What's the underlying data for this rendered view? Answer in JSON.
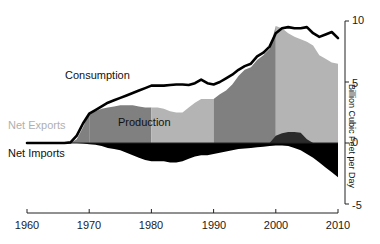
{
  "chart_data": {
    "type": "area",
    "title": "",
    "subtitle": "",
    "xlabel": "",
    "ylabel": "Billion Cubic Feet per Day",
    "xlim": [
      1960,
      2010
    ],
    "ylim": [
      -5,
      10
    ],
    "grid": false,
    "legend_position": "inline-annotations",
    "x_ticks": [
      1960,
      1970,
      1980,
      1990,
      2000,
      2010
    ],
    "y_ticks": [
      -5,
      0,
      5,
      10
    ],
    "annotations": [
      {
        "text": "Consumption",
        "series": "consumption",
        "color": "#111111"
      },
      {
        "text": "Production",
        "series": "production",
        "color": "#111111"
      },
      {
        "text": "Net Exports",
        "series": "net_exports",
        "color": "#b0b0b0"
      },
      {
        "text": "Net Imports",
        "series": "net_imports",
        "color": "#111111"
      }
    ],
    "colors": {
      "production_dark": "#808080",
      "production_light": "#b4b4b4",
      "net_imports": "#000000",
      "net_exports": "#2b2b2b",
      "consumption_line": "#000000",
      "axis": "#222222"
    },
    "x": [
      1960,
      1961,
      1962,
      1963,
      1964,
      1965,
      1966,
      1967,
      1968,
      1969,
      1970,
      1971,
      1972,
      1973,
      1974,
      1975,
      1976,
      1977,
      1978,
      1979,
      1980,
      1981,
      1982,
      1983,
      1984,
      1985,
      1986,
      1987,
      1988,
      1989,
      1990,
      1991,
      1992,
      1993,
      1994,
      1995,
      1996,
      1997,
      1998,
      1999,
      2000,
      2001,
      2002,
      2003,
      2004,
      2005,
      2006,
      2007,
      2008,
      2009,
      2010
    ],
    "series": [
      {
        "name": "Consumption",
        "key": "consumption",
        "type": "line",
        "values": [
          0.0,
          0.0,
          0.0,
          0.0,
          0.0,
          0.0,
          0.0,
          0.05,
          0.6,
          1.6,
          2.4,
          2.7,
          3.0,
          3.3,
          3.5,
          3.7,
          3.9,
          4.1,
          4.3,
          4.5,
          4.7,
          4.7,
          4.7,
          4.75,
          4.8,
          4.8,
          4.75,
          4.9,
          5.2,
          4.9,
          4.8,
          5.0,
          5.3,
          5.6,
          6.0,
          6.3,
          6.5,
          7.1,
          7.4,
          7.9,
          9.0,
          9.4,
          9.5,
          9.4,
          9.4,
          9.5,
          9.0,
          8.7,
          8.9,
          9.1,
          8.6
        ]
      },
      {
        "name": "Production",
        "key": "production",
        "type": "area",
        "values": [
          0.0,
          0.0,
          0.0,
          0.0,
          0.0,
          0.0,
          0.0,
          0.0,
          0.3,
          1.3,
          2.4,
          2.6,
          2.8,
          2.9,
          3.0,
          3.1,
          3.1,
          3.1,
          3.0,
          2.9,
          2.9,
          2.9,
          2.8,
          2.6,
          2.5,
          2.5,
          2.9,
          3.3,
          3.6,
          3.6,
          3.6,
          4.0,
          4.3,
          4.8,
          5.5,
          6.0,
          6.2,
          6.8,
          7.2,
          7.7,
          9.6,
          9.4,
          9.0,
          8.7,
          8.5,
          8.3,
          8.0,
          7.2,
          6.9,
          6.6,
          6.5
        ]
      },
      {
        "name": "Net Imports",
        "key": "net_imports",
        "type": "area",
        "values": [
          0.0,
          0.0,
          0.0,
          0.0,
          0.0,
          0.0,
          0.0,
          0.0,
          0.0,
          -0.05,
          -0.1,
          -0.15,
          -0.25,
          -0.4,
          -0.5,
          -0.6,
          -0.8,
          -1.0,
          -1.2,
          -1.4,
          -1.5,
          -1.5,
          -1.5,
          -1.6,
          -1.6,
          -1.5,
          -1.3,
          -1.1,
          -1.0,
          -1.0,
          -0.9,
          -0.8,
          -0.7,
          -0.6,
          -0.5,
          -0.45,
          -0.4,
          -0.35,
          -0.3,
          -0.25,
          -0.2,
          -0.2,
          -0.25,
          -0.4,
          -0.6,
          -0.9,
          -1.2,
          -1.6,
          -2.0,
          -2.4,
          -2.8
        ]
      },
      {
        "name": "Net Exports",
        "key": "net_exports",
        "type": "area",
        "values": [
          0.0,
          0.0,
          0.0,
          0.0,
          0.0,
          0.0,
          0.0,
          0.0,
          0.0,
          0.0,
          0.0,
          0.0,
          0.0,
          0.0,
          0.0,
          0.0,
          0.0,
          0.0,
          0.0,
          0.0,
          0.0,
          0.0,
          0.0,
          0.0,
          0.0,
          0.0,
          0.0,
          0.0,
          0.0,
          0.0,
          0.0,
          0.0,
          0.0,
          0.0,
          0.0,
          0.0,
          0.0,
          0.0,
          0.0,
          0.0,
          0.6,
          0.8,
          0.9,
          0.9,
          0.85,
          0.3,
          0.0,
          0.0,
          0.0,
          0.0,
          0.0
        ]
      }
    ],
    "decade_bands": [
      {
        "from": 1970,
        "to": 1980,
        "shade": "dark"
      },
      {
        "from": 1980,
        "to": 1990,
        "shade": "light"
      },
      {
        "from": 1990,
        "to": 2000,
        "shade": "dark"
      },
      {
        "from": 2000,
        "to": 2010,
        "shade": "light"
      }
    ]
  },
  "labels": {
    "consumption": "Consumption",
    "production": "Production",
    "net_exports": "Net Exports",
    "net_imports": "Net Imports",
    "y_axis_title": "Billion Cubic Feet per Day"
  },
  "x_tick_labels": [
    "1960",
    "1970",
    "1980",
    "1990",
    "2000",
    "2010"
  ],
  "y_tick_labels": [
    "10",
    "5",
    "0",
    "-5"
  ]
}
